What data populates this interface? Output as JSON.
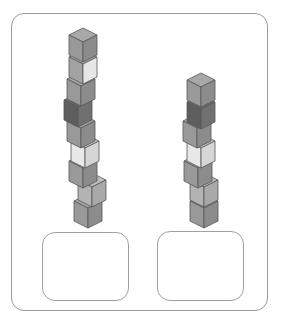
{
  "figure": {
    "colors": {
      "border": "#9a9a9a",
      "cube_edge": "#555555"
    },
    "towers": [
      {
        "name": "left-tower",
        "cube_count": 9,
        "cubes": [
          {
            "x": 69,
            "y": 28,
            "shade": "mid"
          },
          {
            "x": 69,
            "y": 50,
            "shade": "light"
          },
          {
            "x": 67,
            "y": 72,
            "shade": "mid"
          },
          {
            "x": 64,
            "y": 93,
            "shade": "dark"
          },
          {
            "x": 67,
            "y": 114,
            "shade": "mid"
          },
          {
            "x": 71,
            "y": 134,
            "shade": "pale"
          },
          {
            "x": 69,
            "y": 154,
            "shade": "mid"
          },
          {
            "x": 78,
            "y": 173,
            "shade": "lightmid"
          },
          {
            "x": 74,
            "y": 194,
            "shade": "mid"
          }
        ]
      },
      {
        "name": "right-tower",
        "cube_count": 7,
        "cubes": [
          {
            "x": 187,
            "y": 73,
            "shade": "mid"
          },
          {
            "x": 187,
            "y": 95,
            "shade": "dark"
          },
          {
            "x": 183,
            "y": 114,
            "shade": "mid"
          },
          {
            "x": 187,
            "y": 134,
            "shade": "pale"
          },
          {
            "x": 184,
            "y": 154,
            "shade": "mid"
          },
          {
            "x": 190,
            "y": 173,
            "shade": "lightmid"
          },
          {
            "x": 190,
            "y": 194,
            "shade": "mid"
          }
        ]
      }
    ],
    "shades": {
      "mid": {
        "top": "#a8a8a8",
        "left": "#999999",
        "right": "#8c8c8c"
      },
      "light": {
        "top": "#b0b0b0",
        "left": "#a3a3a3",
        "right": "#e6e6e6"
      },
      "dark": {
        "top": "#6a6a6a",
        "left": "#5e5e5e",
        "right": "#707070"
      },
      "pale": {
        "top": "#cfcfcf",
        "left": "#e8e8e8",
        "right": "#d6d6d6"
      },
      "lightmid": {
        "top": "#bdbdbd",
        "left": "#b3b3b3",
        "right": "#a9a9a9"
      }
    },
    "answer_boxes": [
      {
        "name": "left-answer-box",
        "value": ""
      },
      {
        "name": "right-answer-box",
        "value": ""
      }
    ]
  }
}
